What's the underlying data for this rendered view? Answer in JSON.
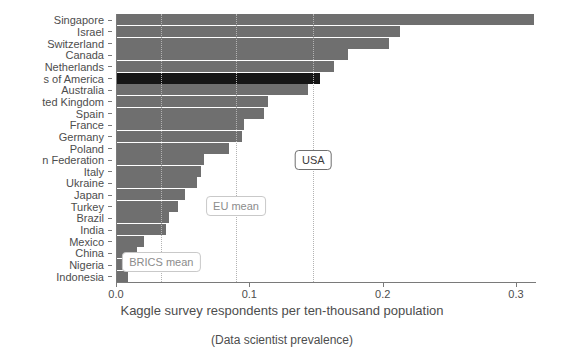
{
  "chart_data": {
    "type": "bar",
    "orientation": "horizontal",
    "title": "",
    "xlabel": "Kaggle survey respondents per ten-thousand population",
    "subtitle": "(Data scientist prevalence)",
    "ylabel": "",
    "xlim": [
      0.0,
      0.315
    ],
    "xticks": [
      0.0,
      0.1,
      0.2,
      0.3
    ],
    "xticklabels": [
      "0.0",
      "0.1",
      "0.2",
      "0.3"
    ],
    "grid": false,
    "legend": "none",
    "bar_color": "#6f6f6f",
    "highlight_color": "#161616",
    "highlight_category": "s of America",
    "categories": [
      "Singapore",
      "Israel",
      "Switzerland",
      "Canada",
      "Netherlands",
      "s of America",
      "Australia",
      "ted Kingdom",
      "Spain",
      "France",
      "Germany",
      "Poland",
      "n Federation",
      "Italy",
      "Ukraine",
      "Japan",
      "Turkey",
      "Brazil",
      "India",
      "Mexico",
      "China",
      "Nigeria",
      "Indonesia"
    ],
    "values": [
      0.313,
      0.212,
      0.204,
      0.173,
      0.163,
      0.152,
      0.143,
      0.113,
      0.11,
      0.095,
      0.094,
      0.084,
      0.065,
      0.063,
      0.06,
      0.051,
      0.046,
      0.039,
      0.037,
      0.02,
      0.015,
      0.012,
      0.008
    ],
    "annotations": [
      {
        "label": "BRICS mean",
        "value": 0.034,
        "style": "muted"
      },
      {
        "label": "EU mean",
        "value": 0.09,
        "style": "muted"
      },
      {
        "label": "USA",
        "value": 0.148,
        "style": "strong"
      }
    ]
  }
}
